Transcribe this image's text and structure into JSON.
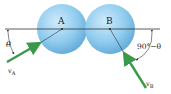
{
  "diagram": {
    "spheres": [
      {
        "label": "A",
        "cx": 62,
        "cy": 29,
        "r": 25
      },
      {
        "label": "B",
        "cx": 110,
        "cy": 29,
        "r": 25
      }
    ],
    "line_of_impact": {
      "x1": 5,
      "x2": 160,
      "y": 29
    },
    "velocities": [
      {
        "label": "v",
        "subscript": "A",
        "from": [
          7,
          62
        ],
        "to": [
          40,
          43
        ]
      },
      {
        "label": "v",
        "subscript": "B",
        "from": [
          146,
          88
        ],
        "to": [
          124,
          53
        ]
      }
    ],
    "angles": [
      {
        "label": "θ",
        "at": "left"
      },
      {
        "label": "90°−θ",
        "at": "right"
      }
    ],
    "colors": {
      "sphere_fill": "#8fcbee",
      "sphere_edge": "#5fa8d6",
      "arrow": "#3a9a4a",
      "line": "#333333"
    }
  }
}
